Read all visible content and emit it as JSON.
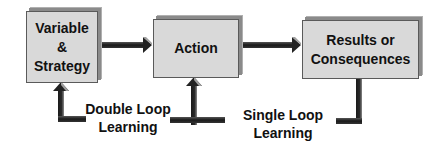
{
  "diagram": {
    "nodes": [
      {
        "id": "variable-strategy",
        "lines": [
          "Variable",
          "&",
          "Strategy"
        ]
      },
      {
        "id": "action",
        "lines": [
          "Action"
        ]
      },
      {
        "id": "results",
        "lines": [
          "Results or",
          "Consequences"
        ]
      }
    ],
    "labels": {
      "double_loop": [
        "Double Loop",
        "Learning"
      ],
      "single_loop": [
        "Single Loop",
        "Learning"
      ]
    },
    "edges": [
      {
        "from": "variable-strategy",
        "to": "action"
      },
      {
        "from": "action",
        "to": "results"
      },
      {
        "from": "results",
        "to": "action",
        "label": "Single Loop Learning"
      },
      {
        "from": "results",
        "to": "variable-strategy",
        "label": "Double Loop Learning"
      }
    ],
    "colors": {
      "box_fill": "#d9d9d9",
      "arrow": "#222222",
      "arrow_highlight": "#9a9a9a"
    }
  }
}
